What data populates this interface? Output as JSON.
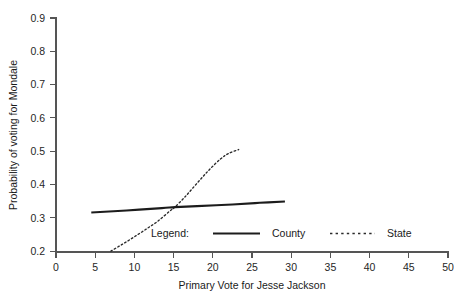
{
  "chart_data": {
    "type": "line",
    "title": "",
    "xlabel": "Primary Vote for Jesse Jackson",
    "ylabel": "Probability of voting for Mondale",
    "xlim": [
      0,
      50
    ],
    "ylim": [
      0.2,
      0.9
    ],
    "grid": false,
    "legend_position": "inside-bottom-center",
    "legend_title": "Legend:",
    "xticks": [
      "0",
      "5",
      "10",
      "15",
      "20",
      "25",
      "30",
      "35",
      "40",
      "45",
      "50"
    ],
    "xtick_values": [
      0,
      5,
      10,
      15,
      20,
      25,
      30,
      35,
      40,
      45,
      50
    ],
    "yticks": [
      "0.2",
      "0.3",
      "0.4",
      "0.5",
      "0.6",
      "0.7",
      "0.8",
      "0.9"
    ],
    "ytick_values": [
      0.2,
      0.3,
      0.4,
      0.5,
      0.6,
      0.7,
      0.8,
      0.9
    ],
    "series": [
      {
        "name": "County",
        "style": "solid",
        "color": "#1c1c1c",
        "x": [
          4.5,
          9.0,
          13.5,
          15.2,
          18.0,
          22.5,
          26.0,
          29.2
        ],
        "y": [
          0.316,
          0.322,
          0.329,
          0.332,
          0.335,
          0.34,
          0.345,
          0.349
        ]
      },
      {
        "name": "State",
        "style": "dotted",
        "color": "#2b2b2b",
        "x": [
          7.0,
          8.5,
          10.0,
          11.5,
          13.0,
          14.5,
          15.2,
          16.5,
          18.0,
          19.5,
          21.0,
          22.0,
          23.3
        ],
        "y": [
          0.2,
          0.221,
          0.243,
          0.266,
          0.29,
          0.32,
          0.333,
          0.364,
          0.404,
          0.443,
          0.477,
          0.493,
          0.505
        ]
      }
    ]
  },
  "legend": {
    "label": "Legend:",
    "entries": [
      {
        "label": "County",
        "style": "solid"
      },
      {
        "label": "State",
        "style": "dotted"
      }
    ]
  },
  "axes": {
    "x_title": "Primary Vote for Jesse Jackson",
    "y_title": "Probability of voting for Mondale"
  }
}
